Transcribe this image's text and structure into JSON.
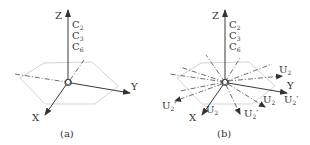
{
  "figure": {
    "panels": [
      {
        "id": "a",
        "caption": "(a)",
        "origin_label": "O",
        "axes": {
          "z": "Z",
          "y": "Y",
          "x": "X"
        },
        "z_axis_symmetry_labels": [
          {
            "base": "C",
            "sub": "2"
          },
          {
            "base": "C",
            "sub": "3"
          },
          {
            "base": "C",
            "sub": "6"
          }
        ]
      },
      {
        "id": "b",
        "caption": "(b)",
        "origin_label": "O",
        "axes": {
          "z": "Z",
          "y": "Y",
          "x": "X"
        },
        "z_axis_symmetry_labels": [
          {
            "base": "C",
            "sub": "2"
          },
          {
            "base": "C",
            "sub": "3"
          },
          {
            "base": "C",
            "sub": "6"
          }
        ],
        "in_plane_axis_labels": [
          {
            "base": "U",
            "sub": "2",
            "prime": "",
            "position": "upper-right"
          },
          {
            "base": "U",
            "sub": "2",
            "prime": "′",
            "position": "right-below-y"
          },
          {
            "base": "U",
            "sub": "2",
            "prime": "",
            "position": "lower-right"
          },
          {
            "base": "U",
            "sub": "2",
            "prime": "′",
            "position": "bottom"
          },
          {
            "base": "U",
            "sub": "2",
            "prime": "",
            "position": "near-x"
          },
          {
            "base": "U",
            "sub": "2",
            "prime": "′",
            "position": "left"
          }
        ]
      }
    ],
    "colors": {
      "axis": "#3a3a3a",
      "hexagon": "#c8c8c8",
      "dashdot": "#4a4a4a",
      "text": "#333333"
    }
  }
}
